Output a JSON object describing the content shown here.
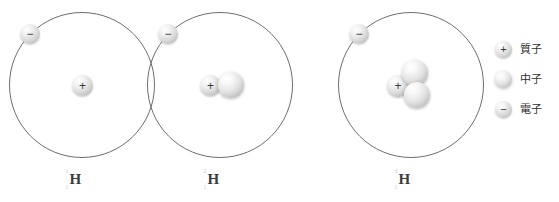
{
  "diagram": {
    "background_color": "#ffffff",
    "orbit_stroke_color": "#6e6e6e",
    "text_color": "#2f2f2f"
  },
  "atoms": [
    {
      "id": "protium",
      "mass_number": "1",
      "atomic_number": "1",
      "element_symbol": "H",
      "proton_count": 1,
      "neutron_count": 0,
      "electron_count": 1,
      "proton_sign": "+",
      "electron_sign": "−"
    },
    {
      "id": "deuterium",
      "mass_number": "2",
      "atomic_number": "1",
      "element_symbol": "H",
      "proton_count": 1,
      "neutron_count": 1,
      "electron_count": 1,
      "proton_sign": "+",
      "electron_sign": "−"
    },
    {
      "id": "tritium",
      "mass_number": "3",
      "atomic_number": "1",
      "element_symbol": "H",
      "proton_count": 1,
      "neutron_count": 2,
      "electron_count": 1,
      "proton_sign": "+",
      "electron_sign": "−"
    }
  ],
  "legend": {
    "items": [
      {
        "key": "proton",
        "label": "質子",
        "sign": "+"
      },
      {
        "key": "neutron",
        "label": "中子",
        "sign": ""
      },
      {
        "key": "electron",
        "label": "電子",
        "sign": "−"
      }
    ]
  }
}
